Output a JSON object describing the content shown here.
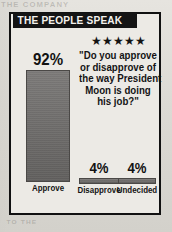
{
  "banner": {
    "title": "THE PEOPLE SPEAK"
  },
  "question": {
    "stars": "★★★★★",
    "star_count": 5,
    "lines": [
      "\"Do you approve",
      "or disapprove of",
      "the way President",
      "Moon is doing",
      "his job?\""
    ],
    "full_text": "\"Do you approve or disapprove of the way President Moon is doing his job?\""
  },
  "chart_data": {
    "type": "bar",
    "title": "THE PEOPLE SPEAK",
    "annotations": [
      "\"Do you approve or disapprove of the way President Moon is doing his job?\""
    ],
    "categories": [
      "Approve",
      "Disapprove",
      "Undecided"
    ],
    "values": [
      92,
      4,
      4
    ],
    "value_labels": [
      "92%",
      "4%",
      "4%"
    ],
    "xlabel": "",
    "ylabel": "",
    "ylim": [
      0,
      100
    ],
    "grid": false,
    "legend": "none",
    "units": "percent",
    "bar_color": "#6f6d6b"
  },
  "colors": {
    "banner_background": "#141414",
    "banner_text": "#f4f2ee",
    "bar_fill": "#6f6d6b",
    "frame": "#111111",
    "panel_background": "#eceae5",
    "page_background": "#dcdad4"
  },
  "ghost_text": {
    "top_left": "THE COMPANY",
    "top_right": "AND",
    "bottom_left": "TO THE",
    "bottom_right": "SAID"
  }
}
